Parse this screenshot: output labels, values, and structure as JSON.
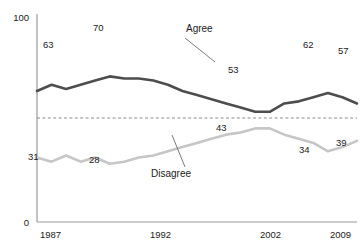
{
  "chart_data": {
    "type": "line",
    "title": "",
    "title_clipped": true,
    "xlabel": "",
    "ylabel": "",
    "ylim": [
      0,
      100
    ],
    "y_tick_labels": [
      "100",
      "0"
    ],
    "x_tick_labels": [
      "1987",
      "1992",
      "2002",
      "2009"
    ],
    "grid": false,
    "legend_position": "inline-annotations",
    "reference_line": {
      "value": 50,
      "style": "dashed",
      "color": "#8c8c8c"
    },
    "series": [
      {
        "name": "Agree",
        "color": "#4d4d4d",
        "label_position": "above-line",
        "x": [
          1987,
          1988,
          1989,
          1990,
          1991,
          1992,
          1993,
          1994,
          1995,
          1996,
          1997,
          1998,
          1999,
          2000,
          2001,
          2002,
          2003,
          2004,
          2005,
          2006,
          2007,
          2008,
          2009
        ],
        "values": [
          63,
          66,
          64,
          66,
          68,
          70,
          69,
          69,
          68,
          66,
          63,
          61,
          59,
          57,
          55,
          53,
          53,
          57,
          58,
          60,
          62,
          60,
          57
        ],
        "labeled_points": [
          {
            "x": 1987,
            "value": 63,
            "label": "63"
          },
          {
            "x": 1992,
            "value": 70,
            "label": "70"
          },
          {
            "x": 2002,
            "value": 53,
            "label": "53"
          },
          {
            "x": 2007,
            "value": 62,
            "label": "62"
          },
          {
            "x": 2009,
            "value": 57,
            "label": "57"
          }
        ]
      },
      {
        "name": "Disagree",
        "color": "#c6c6c6",
        "label_position": "below-line",
        "x": [
          1987,
          1988,
          1989,
          1990,
          1991,
          1992,
          1993,
          1994,
          1995,
          1996,
          1997,
          1998,
          1999,
          2000,
          2001,
          2002,
          2003,
          2004,
          2005,
          2006,
          2007,
          2008,
          2009
        ],
        "values": [
          31,
          29,
          32,
          29,
          31,
          28,
          29,
          31,
          32,
          34,
          36,
          38,
          40,
          42,
          43,
          45,
          45,
          42,
          40,
          38,
          34,
          36,
          39
        ],
        "labeled_points": [
          {
            "x": 1987,
            "value": 31,
            "label": "31"
          },
          {
            "x": 1992,
            "value": 28,
            "label": "28"
          },
          {
            "x": 2001,
            "value": 43,
            "label": "43"
          },
          {
            "x": 2007,
            "value": 34,
            "label": "34"
          },
          {
            "x": 2009,
            "value": 39,
            "label": "39"
          }
        ]
      }
    ],
    "annotations": [
      {
        "text": "Agree",
        "name": "agree-series-annotation",
        "text_x": 186,
        "text_y": 32,
        "leader_from": [
          185,
          38
        ],
        "leader_to": [
          215,
          62
        ]
      },
      {
        "text": "Disagree",
        "name": "disagree-series-annotation",
        "text_x": 151,
        "text_y": 174,
        "leader_from": [
          185,
          167
        ],
        "leader_to": [
          172,
          135
        ]
      }
    ],
    "axis": {
      "y_axis_x": 37,
      "plot_top_y": 14,
      "plot_bottom_y": 222,
      "plot_right_x": 357
    }
  },
  "labels": {
    "y_top": "100",
    "y_bottom": "0",
    "x1": "1987",
    "x2": "1992",
    "x3": "2002",
    "x4": "2009",
    "agree": "Agree",
    "disagree": "Disagree",
    "agree_1987": "63",
    "agree_peak": "70",
    "agree_2002": "53",
    "agree_2007": "62",
    "agree_2009": "57",
    "disagree_1987": "31",
    "disagree_min": "28",
    "disagree_2001": "43",
    "disagree_2007": "34",
    "disagree_2009": "39"
  },
  "colors": {
    "agree_line": "#4d4d4d",
    "disagree_line": "#c6c6c6",
    "axis": "#9a9a9a",
    "reference_line": "#8c8c8c",
    "text": "#1a1a1a",
    "background": "#ffffff"
  }
}
